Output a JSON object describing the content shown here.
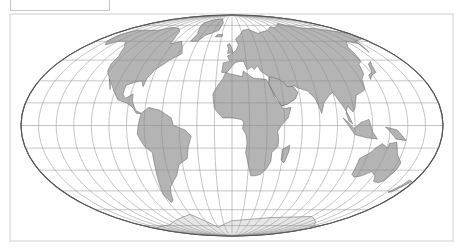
{
  "map": {
    "projection": "Mollweide",
    "frame": {
      "x": 10,
      "y": 14,
      "width": 443,
      "height": 227,
      "stroke": "#cfcfcf"
    },
    "label_box": {
      "x": 10,
      "y": -2,
      "width": 98,
      "height": 12,
      "text": ""
    },
    "ellipse": {
      "cx": 232,
      "cy": 125.5,
      "rx": 211,
      "ry": 110.5,
      "stroke": "#555555"
    },
    "graticule": {
      "lon_step_deg": 15,
      "lat_step_deg": 15,
      "stroke": "#8a8a8a"
    },
    "colors": {
      "land_fill": "#b4b4b4",
      "land_dark": "#7a7a7a",
      "land_stroke": "#5a5a5a",
      "ocean": "#ffffff"
    },
    "continents": [
      {
        "name": "north-america",
        "pts": [
          [
            -168,
            66
          ],
          [
            -160,
            70
          ],
          [
            -140,
            70
          ],
          [
            -125,
            70
          ],
          [
            -110,
            73
          ],
          [
            -95,
            72
          ],
          [
            -85,
            69
          ],
          [
            -80,
            63
          ],
          [
            -78,
            58
          ],
          [
            -66,
            60
          ],
          [
            -60,
            55
          ],
          [
            -56,
            50
          ],
          [
            -66,
            45
          ],
          [
            -70,
            42
          ],
          [
            -76,
            38
          ],
          [
            -80,
            32
          ],
          [
            -81,
            26
          ],
          [
            -84,
            30
          ],
          [
            -90,
            29
          ],
          [
            -97,
            27
          ],
          [
            -97,
            21
          ],
          [
            -94,
            18
          ],
          [
            -88,
            21
          ],
          [
            -87,
            16
          ],
          [
            -83,
            10
          ],
          [
            -78,
            8
          ],
          [
            -82,
            8
          ],
          [
            -86,
            12
          ],
          [
            -92,
            15
          ],
          [
            -100,
            17
          ],
          [
            -106,
            23
          ],
          [
            -112,
            29
          ],
          [
            -115,
            31
          ],
          [
            -110,
            24
          ],
          [
            -112,
            28
          ],
          [
            -117,
            33
          ],
          [
            -122,
            37
          ],
          [
            -124,
            42
          ],
          [
            -124,
            48
          ],
          [
            -130,
            55
          ],
          [
            -140,
            60
          ],
          [
            -150,
            60
          ],
          [
            -158,
            57
          ],
          [
            -165,
            60
          ]
        ]
      },
      {
        "name": "greenland",
        "pts": [
          [
            -55,
            60
          ],
          [
            -45,
            60
          ],
          [
            -40,
            65
          ],
          [
            -22,
            70
          ],
          [
            -20,
            78
          ],
          [
            -30,
            83
          ],
          [
            -50,
            82
          ],
          [
            -65,
            78
          ],
          [
            -58,
            72
          ],
          [
            -52,
            66
          ]
        ]
      },
      {
        "name": "south-america",
        "pts": [
          [
            -78,
            8
          ],
          [
            -72,
            12
          ],
          [
            -62,
            10
          ],
          [
            -52,
            5
          ],
          [
            -50,
            0
          ],
          [
            -40,
            -3
          ],
          [
            -35,
            -7
          ],
          [
            -38,
            -14
          ],
          [
            -40,
            -22
          ],
          [
            -48,
            -26
          ],
          [
            -53,
            -34
          ],
          [
            -58,
            -38
          ],
          [
            -63,
            -42
          ],
          [
            -66,
            -47
          ],
          [
            -68,
            -52
          ],
          [
            -72,
            -54
          ],
          [
            -75,
            -48
          ],
          [
            -73,
            -40
          ],
          [
            -71,
            -30
          ],
          [
            -70,
            -18
          ],
          [
            -76,
            -14
          ],
          [
            -81,
            -6
          ],
          [
            -80,
            0
          ]
        ]
      },
      {
        "name": "europe-asia",
        "pts": [
          [
            -10,
            36
          ],
          [
            -9,
            43
          ],
          [
            -2,
            44
          ],
          [
            -5,
            48
          ],
          [
            2,
            51
          ],
          [
            5,
            53
          ],
          [
            8,
            57
          ],
          [
            5,
            62
          ],
          [
            12,
            66
          ],
          [
            18,
            70
          ],
          [
            28,
            71
          ],
          [
            40,
            67
          ],
          [
            45,
            68
          ],
          [
            60,
            70
          ],
          [
            70,
            73
          ],
          [
            80,
            73
          ],
          [
            100,
            77
          ],
          [
            115,
            74
          ],
          [
            130,
            72
          ],
          [
            145,
            72
          ],
          [
            160,
            70
          ],
          [
            175,
            68
          ],
          [
            180,
            66
          ],
          [
            178,
            62
          ],
          [
            163,
            60
          ],
          [
            156,
            51
          ],
          [
            160,
            58
          ],
          [
            150,
            60
          ],
          [
            140,
            55
          ],
          [
            135,
            44
          ],
          [
            130,
            42
          ],
          [
            127,
            35
          ],
          [
            122,
            31
          ],
          [
            120,
            24
          ],
          [
            110,
            20
          ],
          [
            108,
            16
          ],
          [
            106,
            11
          ],
          [
            104,
            9
          ],
          [
            100,
            13
          ],
          [
            98,
            8
          ],
          [
            100,
            3
          ],
          [
            103,
            1
          ],
          [
            98,
            10
          ],
          [
            94,
            16
          ],
          [
            90,
            22
          ],
          [
            86,
            20
          ],
          [
            80,
            15
          ],
          [
            77,
            8
          ],
          [
            73,
            18
          ],
          [
            68,
            23
          ],
          [
            60,
            25
          ],
          [
            56,
            27
          ],
          [
            52,
            24
          ],
          [
            56,
            18
          ],
          [
            52,
            16
          ],
          [
            44,
            13
          ],
          [
            38,
            20
          ],
          [
            34,
            28
          ],
          [
            35,
            33
          ],
          [
            28,
            37
          ],
          [
            26,
            41
          ],
          [
            22,
            38
          ],
          [
            20,
            40
          ],
          [
            15,
            38
          ],
          [
            12,
            44
          ],
          [
            8,
            44
          ],
          [
            3,
            43
          ],
          [
            -5,
            36
          ]
        ]
      },
      {
        "name": "africa",
        "pts": [
          [
            -17,
            21
          ],
          [
            -16,
            15
          ],
          [
            -15,
            11
          ],
          [
            -8,
            5
          ],
          [
            0,
            5
          ],
          [
            8,
            4
          ],
          [
            10,
            2
          ],
          [
            9,
            -2
          ],
          [
            12,
            -6
          ],
          [
            13,
            -12
          ],
          [
            12,
            -18
          ],
          [
            15,
            -27
          ],
          [
            18,
            -34
          ],
          [
            22,
            -34
          ],
          [
            27,
            -33
          ],
          [
            32,
            -29
          ],
          [
            35,
            -24
          ],
          [
            35,
            -18
          ],
          [
            40,
            -14
          ],
          [
            40,
            -8
          ],
          [
            39,
            -4
          ],
          [
            42,
            0
          ],
          [
            48,
            5
          ],
          [
            51,
            12
          ],
          [
            44,
            11
          ],
          [
            43,
            13
          ],
          [
            38,
            18
          ],
          [
            34,
            28
          ],
          [
            32,
            31
          ],
          [
            20,
            32
          ],
          [
            11,
            37
          ],
          [
            10,
            33
          ],
          [
            -2,
            35
          ],
          [
            -6,
            36
          ],
          [
            -9,
            31
          ],
          [
            -13,
            27
          ]
        ]
      },
      {
        "name": "arabia",
        "pts": [
          [
            34,
            28
          ],
          [
            38,
            20
          ],
          [
            43,
            13
          ],
          [
            48,
            14
          ],
          [
            56,
            18
          ],
          [
            59,
            22
          ],
          [
            56,
            26
          ],
          [
            50,
            26
          ],
          [
            48,
            29
          ],
          [
            44,
            31
          ],
          [
            36,
            33
          ]
        ]
      },
      {
        "name": "madagascar",
        "pts": [
          [
            44,
            -16
          ],
          [
            50,
            -13
          ],
          [
            50,
            -17
          ],
          [
            47,
            -25
          ],
          [
            44,
            -23
          ]
        ]
      },
      {
        "name": "australia",
        "pts": [
          [
            114,
            -22
          ],
          [
            114,
            -33
          ],
          [
            118,
            -35
          ],
          [
            124,
            -34
          ],
          [
            131,
            -31
          ],
          [
            137,
            -34
          ],
          [
            140,
            -38
          ],
          [
            146,
            -39
          ],
          [
            150,
            -37
          ],
          [
            153,
            -30
          ],
          [
            153,
            -25
          ],
          [
            146,
            -19
          ],
          [
            142,
            -11
          ],
          [
            136,
            -12
          ],
          [
            136,
            -15
          ],
          [
            130,
            -12
          ],
          [
            125,
            -15
          ],
          [
            122,
            -18
          ]
        ]
      },
      {
        "name": "new-zealand",
        "pts": [
          [
            167,
            -46
          ],
          [
            172,
            -41
          ],
          [
            174,
            -37
          ],
          [
            178,
            -38
          ],
          [
            175,
            -41
          ],
          [
            170,
            -46
          ]
        ]
      },
      {
        "name": "indonesia",
        "pts": [
          [
            95,
            5
          ],
          [
            105,
            -6
          ],
          [
            115,
            -8
          ],
          [
            125,
            -9
          ],
          [
            120,
            -4
          ],
          [
            117,
            4
          ],
          [
            110,
            2
          ],
          [
            104,
            -2
          ],
          [
            98,
            3
          ]
        ]
      },
      {
        "name": "new-guinea",
        "pts": [
          [
            131,
            -1
          ],
          [
            141,
            -3
          ],
          [
            150,
            -10
          ],
          [
            141,
            -9
          ],
          [
            135,
            -4
          ]
        ]
      },
      {
        "name": "japan",
        "pts": [
          [
            130,
            31
          ],
          [
            134,
            34
          ],
          [
            140,
            36
          ],
          [
            142,
            41
          ],
          [
            145,
            44
          ],
          [
            140,
            42
          ],
          [
            136,
            36
          ],
          [
            131,
            34
          ]
        ]
      },
      {
        "name": "uk",
        "pts": [
          [
            -5,
            50
          ],
          [
            1,
            51
          ],
          [
            0,
            54
          ],
          [
            -3,
            58
          ],
          [
            -6,
            57
          ],
          [
            -4,
            54
          ]
        ]
      },
      {
        "name": "iceland",
        "pts": [
          [
            -24,
            64
          ],
          [
            -14,
            64
          ],
          [
            -14,
            66
          ],
          [
            -22,
            66
          ]
        ]
      },
      {
        "name": "antarctica",
        "pts": [
          [
            -180,
            -78
          ],
          [
            -120,
            -74
          ],
          [
            -60,
            -64
          ],
          [
            -30,
            -77
          ],
          [
            0,
            -70
          ],
          [
            60,
            -67
          ],
          [
            120,
            -66
          ],
          [
            180,
            -78
          ],
          [
            180,
            -89.5
          ],
          [
            -180,
            -89.5
          ]
        ]
      }
    ]
  }
}
